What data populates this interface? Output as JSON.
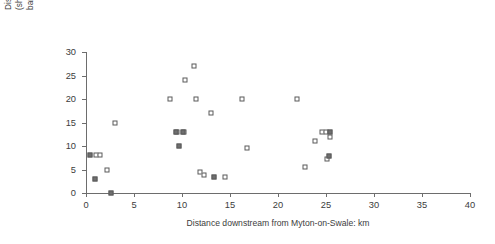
{
  "chart_data": {
    "type": "scatter",
    "title": "",
    "xlabel": "Distance downstream from Myton-on-Swale: km",
    "ylabel_lines": [
      "Distance of left bank from river side of levee: m",
      "(shaded datapoints are locations where severe",
      "bank erosion was recorded)"
    ],
    "ylabel": "Distance of left bank from river side of levee: m (shaded datapoints are locations where severe bank erosion was recorded)",
    "xlim": [
      0,
      40
    ],
    "ylim": [
      0,
      30
    ],
    "xticks": [
      0,
      5,
      10,
      15,
      20,
      25,
      30,
      35,
      40
    ],
    "yticks": [
      0,
      5,
      10,
      15,
      20,
      25,
      30
    ],
    "grid": false,
    "legend": "none",
    "marker": "square",
    "series": [
      {
        "name": "No severe erosion",
        "shaded": false,
        "marker_fill": "#ffffff",
        "marker_edge": "#5a5a5a",
        "points": [
          {
            "x": 1.0,
            "y": 8.0
          },
          {
            "x": 1.5,
            "y": 8.0
          },
          {
            "x": 2.2,
            "y": 5.0
          },
          {
            "x": 3.0,
            "y": 15.0
          },
          {
            "x": 8.7,
            "y": 20.0
          },
          {
            "x": 9.5,
            "y": 13.0
          },
          {
            "x": 10.2,
            "y": 13.0
          },
          {
            "x": 10.3,
            "y": 24.0
          },
          {
            "x": 11.3,
            "y": 27.0
          },
          {
            "x": 11.5,
            "y": 20.0
          },
          {
            "x": 11.9,
            "y": 4.5
          },
          {
            "x": 12.3,
            "y": 3.8
          },
          {
            "x": 13.0,
            "y": 17.0
          },
          {
            "x": 14.5,
            "y": 3.5
          },
          {
            "x": 16.3,
            "y": 20.0
          },
          {
            "x": 16.8,
            "y": 9.5
          },
          {
            "x": 22.0,
            "y": 20.0
          },
          {
            "x": 22.8,
            "y": 5.5
          },
          {
            "x": 23.9,
            "y": 11.0
          },
          {
            "x": 24.6,
            "y": 13.0
          },
          {
            "x": 25.0,
            "y": 13.0
          },
          {
            "x": 25.4,
            "y": 12.0
          },
          {
            "x": 25.1,
            "y": 7.3
          }
        ]
      },
      {
        "name": "Severe bank erosion recorded",
        "shaded": true,
        "marker_fill": "#6f6f6f",
        "marker_edge": "#5a5a5a",
        "points": [
          {
            "x": 0.4,
            "y": 8.0
          },
          {
            "x": 0.9,
            "y": 3.0
          },
          {
            "x": 2.6,
            "y": 0.0
          },
          {
            "x": 9.4,
            "y": 13.0
          },
          {
            "x": 9.7,
            "y": 10.0
          },
          {
            "x": 10.1,
            "y": 13.0
          },
          {
            "x": 13.3,
            "y": 3.5
          },
          {
            "x": 25.4,
            "y": 13.0
          },
          {
            "x": 25.3,
            "y": 7.8
          }
        ]
      }
    ]
  }
}
